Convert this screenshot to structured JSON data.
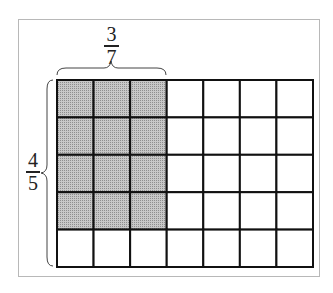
{
  "diagram": {
    "type": "area-model-fraction-multiplication",
    "grid": {
      "rows": 5,
      "cols": 7,
      "shaded_rows": 4,
      "shaded_cols": 3
    },
    "colors": {
      "shade": "#b4b4b4",
      "line": "#111111",
      "frame": "#b8b8b8"
    },
    "top_label": {
      "numerator": "3",
      "denominator": "7"
    },
    "left_label": {
      "numerator": "4",
      "denominator": "5"
    }
  }
}
